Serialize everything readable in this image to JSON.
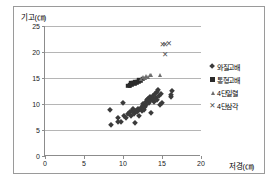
{
  "chart_data": {
    "type": "scatter",
    "title": "",
    "xlabel": "저경(㎝)",
    "ylabel": "기고(㎝)",
    "xlim": [
      0,
      20
    ],
    "ylim": [
      0,
      25
    ],
    "xticks": [
      0,
      5,
      10,
      15,
      20
    ],
    "yticks": [
      0,
      5,
      10,
      15,
      20,
      25
    ],
    "grid": "horizontal",
    "legend_position": "right",
    "series": [
      {
        "name": "와질고배",
        "marker": "diamond",
        "color": "#3b3b3b",
        "points": [
          [
            8.3,
            8.8
          ],
          [
            8.4,
            5.9
          ],
          [
            9.3,
            7.3
          ],
          [
            9.4,
            6.6
          ],
          [
            9.8,
            6.5
          ],
          [
            10.0,
            10.1
          ],
          [
            10.1,
            7.6
          ],
          [
            10.4,
            7.3
          ],
          [
            10.7,
            8.0
          ],
          [
            10.9,
            8.5
          ],
          [
            11.0,
            7.7
          ],
          [
            11.2,
            8.6
          ],
          [
            11.3,
            9.0
          ],
          [
            11.4,
            8.1
          ],
          [
            11.5,
            6.4
          ],
          [
            11.6,
            8.7
          ],
          [
            11.8,
            8.4
          ],
          [
            11.9,
            9.1
          ],
          [
            12.0,
            7.7
          ],
          [
            12.1,
            8.8
          ],
          [
            12.3,
            9.3
          ],
          [
            12.4,
            8.6
          ],
          [
            12.5,
            9.6
          ],
          [
            12.6,
            10.0
          ],
          [
            12.7,
            8.9
          ],
          [
            12.8,
            9.5
          ],
          [
            12.9,
            10.4
          ],
          [
            13.0,
            9.9
          ],
          [
            13.1,
            10.7
          ],
          [
            13.2,
            11.0
          ],
          [
            13.3,
            10.2
          ],
          [
            13.4,
            11.4
          ],
          [
            13.5,
            10.6
          ],
          [
            13.6,
            8.2
          ],
          [
            13.7,
            11.2
          ],
          [
            13.8,
            10.9
          ],
          [
            13.9,
            11.6
          ],
          [
            14.0,
            10.3
          ],
          [
            14.1,
            11.9
          ],
          [
            14.2,
            11.1
          ],
          [
            14.3,
            12.3
          ],
          [
            14.4,
            10.8
          ],
          [
            14.5,
            12.7
          ],
          [
            14.6,
            11.5
          ],
          [
            14.7,
            9.9
          ],
          [
            14.9,
            12.0
          ],
          [
            15.0,
            10.2
          ],
          [
            16.1,
            11.4
          ],
          [
            16.2,
            11.8
          ],
          [
            16.3,
            12.5
          ]
        ]
      },
      {
        "name": "통형고배",
        "marker": "square",
        "color": "#2b2b2b",
        "points": [
          [
            10.7,
            13.5
          ],
          [
            10.9,
            13.6
          ],
          [
            11.0,
            14.0
          ],
          [
            11.1,
            13.8
          ],
          [
            11.3,
            14.1
          ],
          [
            11.5,
            13.9
          ],
          [
            11.6,
            14.3
          ],
          [
            11.8,
            14.2
          ],
          [
            12.0,
            14.4
          ],
          [
            12.1,
            14.6
          ],
          [
            12.3,
            14.5
          ],
          [
            12.5,
            14.8
          ]
        ]
      },
      {
        "name": "4단일렬",
        "marker": "triangle",
        "color": "#6e6e6e",
        "points": [
          [
            12.3,
            14.9
          ],
          [
            12.6,
            15.1
          ],
          [
            12.8,
            15.0
          ],
          [
            13.0,
            15.3
          ],
          [
            13.2,
            15.2
          ],
          [
            13.4,
            15.5
          ],
          [
            13.6,
            15.6
          ],
          [
            14.8,
            15.5
          ]
        ]
      },
      {
        "name": "4단삼각",
        "marker": "cross",
        "color": "#4a4a4a",
        "points": [
          [
            15.1,
            21.6
          ],
          [
            15.4,
            21.5
          ],
          [
            15.9,
            21.8
          ],
          [
            15.4,
            19.6
          ]
        ]
      }
    ]
  }
}
